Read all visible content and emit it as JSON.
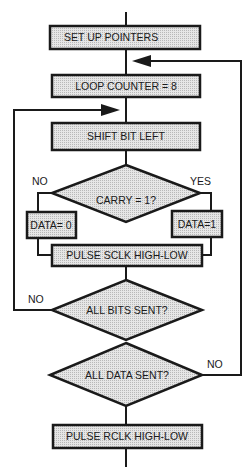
{
  "flowchart": {
    "nodes": {
      "setup": {
        "label": "SET  UP POINTERS",
        "type": "process"
      },
      "loop_counter": {
        "label": "LOOP COUNTER = 8",
        "type": "process"
      },
      "shift": {
        "label": "SHIFT BIT LEFT",
        "type": "process"
      },
      "carry": {
        "label": "CARRY = 1?",
        "type": "decision"
      },
      "data0": {
        "label": "DATA= 0",
        "type": "process"
      },
      "data1": {
        "label": "DATA=1",
        "type": "process"
      },
      "pulse_sclk": {
        "label": "PULSE SCLK HIGH-LOW",
        "type": "process"
      },
      "all_bits": {
        "label": "ALL BITS SENT?",
        "type": "decision"
      },
      "all_data": {
        "label": "ALL DATA SENT?",
        "type": "decision"
      },
      "pulse_rclk": {
        "label": "PULSE RCLK HIGH-LOW",
        "type": "process"
      }
    },
    "edge_labels": {
      "carry_no": "NO",
      "carry_yes": "YES",
      "all_bits_no": "NO",
      "all_data_no": "NO"
    },
    "colors": {
      "line": "#1a1a1a",
      "box_fill": "#d9d9d9"
    }
  }
}
